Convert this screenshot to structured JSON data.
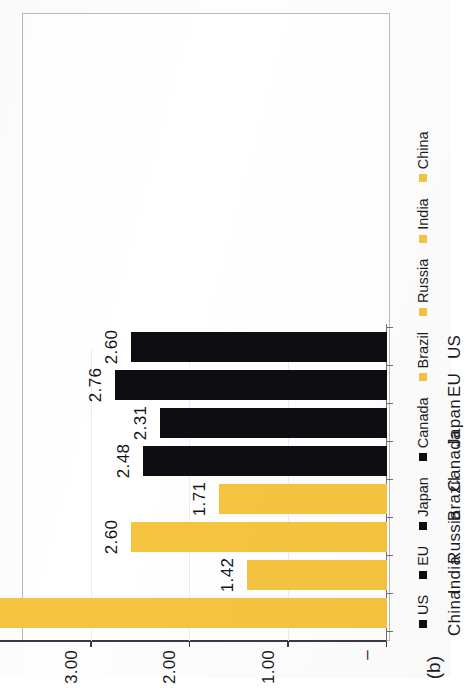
{
  "figure": {
    "subfigure_label": "(b)"
  },
  "chart_data": {
    "type": "bar",
    "title": "",
    "xlabel": "",
    "ylabel": "",
    "categories": [
      "China",
      "India",
      "Russia",
      "Brazil",
      "Canada",
      "Japan",
      "EU",
      "US"
    ],
    "values": [
      4.4,
      1.42,
      2.6,
      1.71,
      2.48,
      2.31,
      2.76,
      2.6
    ],
    "value_labels": [
      "4.40",
      "1.42",
      "2.60",
      "1.71",
      "2.48",
      "2.31",
      "2.76",
      "2.60"
    ],
    "bar_colors": [
      "#f5c440",
      "#f5c440",
      "#f5c440",
      "#f5c440",
      "#0d0d12",
      "#0d0d12",
      "#0d0d12",
      "#0d0d12"
    ],
    "ylim": [
      0,
      5
    ],
    "ytick_values": [
      0,
      1,
      2,
      3,
      4,
      5
    ],
    "ytick_labels": [
      "–",
      "1.00",
      "2.00",
      "3.00",
      "4.00",
      "5.00"
    ],
    "grid": true,
    "grid_axis": "y",
    "legend_position": "right-of-axis",
    "legend": [
      {
        "label": "US",
        "color": "#0d0d12"
      },
      {
        "label": "EU",
        "color": "#0d0d12"
      },
      {
        "label": "Japan",
        "color": "#0d0d12"
      },
      {
        "label": "Canada",
        "color": "#0d0d12"
      },
      {
        "label": "Brazil",
        "color": "#f5c440"
      },
      {
        "label": "Russia",
        "color": "#f5c440"
      },
      {
        "label": "India",
        "color": "#f5c440"
      },
      {
        "label": "China",
        "color": "#f5c440"
      }
    ],
    "rotation_deg": 90,
    "colors": {
      "emerging_economies": "#f5c440",
      "developed_economies": "#0d0d12",
      "axis": "#3a3a3e",
      "grid": "#ededf0",
      "frame": "#b9b9bd"
    }
  }
}
